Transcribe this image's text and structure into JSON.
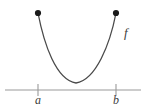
{
  "figure": {
    "type": "function-graph-diagram",
    "canvas": {
      "width": 146,
      "height": 107,
      "background": "#ffffff"
    },
    "colors": {
      "curve": "#4a4a4a",
      "axis": "#9a9a9a",
      "tick": "#9a9a9a",
      "endpoint_dot": "#1a1a1a",
      "label_text": "#3c3c3c"
    },
    "curve": {
      "label": "f",
      "label_x": 124,
      "label_y": 32,
      "stroke_width": 1.3,
      "path": "M 38 13 C 44 44, 56 80, 76 83 C 96 80, 110 44, 116 13",
      "minimum": {
        "x": 76,
        "y": 83
      }
    },
    "endpoints": [
      {
        "name": "left-endpoint",
        "x": 38,
        "y": 13,
        "radius": 3.1,
        "filled": true
      },
      {
        "name": "right-endpoint",
        "x": 116,
        "y": 13,
        "radius": 3.1,
        "filled": true
      }
    ],
    "axis": {
      "y": 90,
      "x_start": 5,
      "x_end": 141,
      "stroke_width": 1.2
    },
    "ticks": [
      {
        "label": "a",
        "x": 38,
        "top": 84,
        "bottom": 96,
        "label_x": 35,
        "label_y": 96
      },
      {
        "label": "b",
        "x": 116,
        "top": 84,
        "bottom": 96,
        "label_x": 113,
        "label_y": 96
      }
    ]
  }
}
